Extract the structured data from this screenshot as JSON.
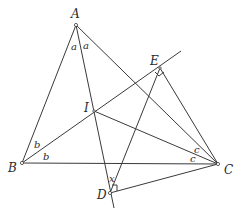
{
  "diagram": {
    "title": "",
    "points": [
      {
        "name": "A",
        "label": "A",
        "x": 76,
        "y": 25,
        "lx": 71,
        "ly": 18
      },
      {
        "name": "B",
        "label": "B",
        "x": 22,
        "y": 163,
        "lx": 9,
        "ly": 171
      },
      {
        "name": "C",
        "label": "C",
        "x": 218,
        "y": 164,
        "lx": 224,
        "ly": 173
      },
      {
        "name": "I",
        "label": "I",
        "x": 94,
        "y": 111,
        "lx": 85,
        "ly": 111
      },
      {
        "name": "E",
        "label": "E",
        "x": 160,
        "y": 68,
        "lx": 150,
        "ly": 64
      },
      {
        "name": "D",
        "label": "D",
        "x": 110,
        "y": 193,
        "lx": 97,
        "ly": 198
      }
    ],
    "segments": [
      {
        "from": "A",
        "to": "B"
      },
      {
        "from": "A",
        "to": "C"
      },
      {
        "from": "B",
        "to": "C"
      },
      {
        "from": "A",
        "to": "D_ext"
      },
      {
        "from": "B",
        "to": "E_ext"
      },
      {
        "from": "C",
        "to": "I"
      },
      {
        "from": "C",
        "to": "E"
      },
      {
        "from": "C",
        "to": "D"
      },
      {
        "from": "D",
        "to": "E"
      }
    ],
    "angle_labels": [
      {
        "text": "a",
        "x": 71,
        "y": 47
      },
      {
        "text": "a",
        "x": 83,
        "y": 46
      },
      {
        "text": "b",
        "x": 35,
        "y": 147
      },
      {
        "text": "b",
        "x": 43,
        "y": 160
      },
      {
        "text": "c",
        "x": 193,
        "y": 152
      },
      {
        "text": "c",
        "x": 190,
        "y": 162
      },
      {
        "text": "x",
        "x": 109,
        "y": 181
      }
    ],
    "right_angles": [
      "E",
      "D"
    ]
  }
}
